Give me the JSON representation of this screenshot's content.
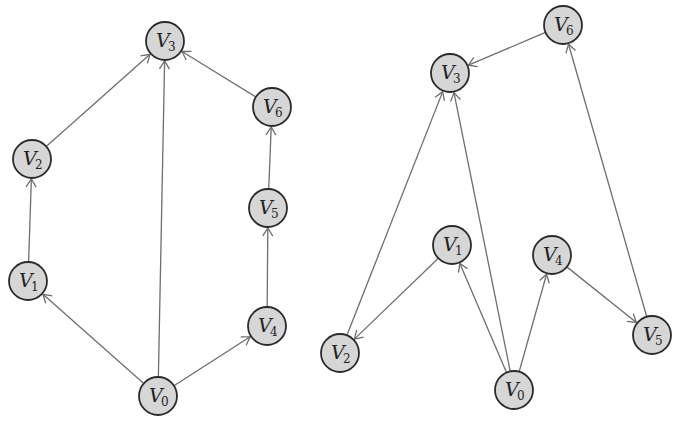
{
  "graphs": [
    {
      "name": "left-graph",
      "node_radius": 19,
      "nodes": [
        {
          "id": "V0",
          "letter": "V",
          "sub": "0",
          "x": 158,
          "y": 396
        },
        {
          "id": "V1",
          "letter": "V",
          "sub": "1",
          "x": 28,
          "y": 281
        },
        {
          "id": "V2",
          "letter": "V",
          "sub": "2",
          "x": 32,
          "y": 159
        },
        {
          "id": "V3",
          "letter": "V",
          "sub": "3",
          "x": 165,
          "y": 41
        },
        {
          "id": "V4",
          "letter": "V",
          "sub": "4",
          "x": 267,
          "y": 326
        },
        {
          "id": "V5",
          "letter": "V",
          "sub": "5",
          "x": 268,
          "y": 208
        },
        {
          "id": "V6",
          "letter": "V",
          "sub": "6",
          "x": 272,
          "y": 107
        }
      ],
      "edges": [
        {
          "from": "V0",
          "to": "V1"
        },
        {
          "from": "V0",
          "to": "V3"
        },
        {
          "from": "V0",
          "to": "V4"
        },
        {
          "from": "V1",
          "to": "V2"
        },
        {
          "from": "V2",
          "to": "V3"
        },
        {
          "from": "V4",
          "to": "V5"
        },
        {
          "from": "V5",
          "to": "V6"
        },
        {
          "from": "V6",
          "to": "V3"
        }
      ]
    },
    {
      "name": "right-graph",
      "node_radius": 19,
      "nodes": [
        {
          "id": "V0",
          "letter": "V",
          "sub": "0",
          "x": 514,
          "y": 390
        },
        {
          "id": "V1",
          "letter": "V",
          "sub": "1",
          "x": 452,
          "y": 245
        },
        {
          "id": "V2",
          "letter": "V",
          "sub": "2",
          "x": 340,
          "y": 353
        },
        {
          "id": "V3",
          "letter": "V",
          "sub": "3",
          "x": 450,
          "y": 73
        },
        {
          "id": "V4",
          "letter": "V",
          "sub": "4",
          "x": 552,
          "y": 255
        },
        {
          "id": "V5",
          "letter": "V",
          "sub": "5",
          "x": 652,
          "y": 335
        },
        {
          "id": "V6",
          "letter": "V",
          "sub": "6",
          "x": 563,
          "y": 25
        }
      ],
      "edges": [
        {
          "from": "V6",
          "to": "V3"
        },
        {
          "from": "V2",
          "to": "V3"
        },
        {
          "from": "V0",
          "to": "V3"
        },
        {
          "from": "V1",
          "to": "V2"
        },
        {
          "from": "V0",
          "to": "V1"
        },
        {
          "from": "V0",
          "to": "V4"
        },
        {
          "from": "V4",
          "to": "V5"
        },
        {
          "from": "V5",
          "to": "V6"
        }
      ]
    }
  ],
  "colors": {
    "node_fill": "#d6d6d6",
    "node_stroke": "#2b2b2b",
    "edge": "#6e6e6e",
    "background": "#ffffff"
  }
}
